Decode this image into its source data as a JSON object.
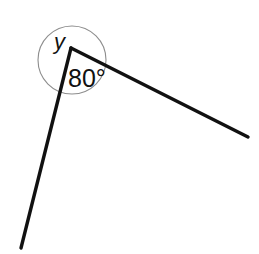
{
  "diagram": {
    "background_color": "#ffffff",
    "labels": {
      "reflex_angle": "y",
      "interior_angle": "80°"
    },
    "geometry": {
      "vertex": {
        "x": 71,
        "y": 48
      },
      "rays": [
        {
          "name": "left-ray",
          "from": {
            "x": 71,
            "y": 48
          },
          "to": {
            "x": 21,
            "y": 248
          }
        },
        {
          "name": "right-ray",
          "from": {
            "x": 71,
            "y": 48
          },
          "to": {
            "x": 248,
            "y": 137
          }
        }
      ],
      "angle_circle": {
        "center": {
          "x": 72,
          "y": 60
        },
        "radius": 34
      }
    },
    "colors": {
      "ray_stroke": "#111111",
      "arc_stroke": "#8d8d8d",
      "text": "#111111"
    },
    "label_positions": {
      "reflex_angle": {
        "x": 54,
        "y": 49
      },
      "interior_angle": {
        "x": 68,
        "y": 87
      }
    }
  }
}
